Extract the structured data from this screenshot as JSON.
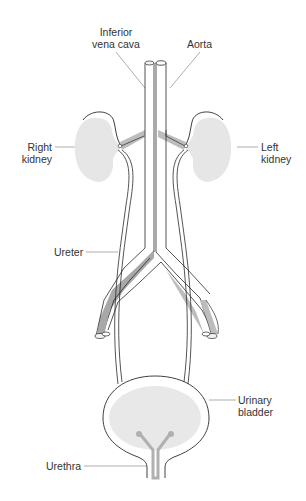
{
  "figure": {
    "type": "anatomical-diagram",
    "colors": {
      "background": "#ffffff",
      "outline": "#2a2a2a",
      "tissue_fill": "#e6e6e6",
      "vein_fill": "#a8a8a8",
      "leader_line": "#8a8a8a",
      "label_text": "#333333"
    }
  },
  "labels": {
    "ivc": {
      "line1": "Inferior",
      "line2": "vena cava"
    },
    "aorta": {
      "line1": "Aorta"
    },
    "right_kidney": {
      "line1": "Right",
      "line2": "kidney"
    },
    "left_kidney": {
      "line1": "Left",
      "line2": "kidney"
    },
    "ureter": {
      "line1": "Ureter"
    },
    "bladder": {
      "line1": "Urinary",
      "line2": "bladder"
    },
    "urethra": {
      "line1": "Urethra"
    }
  }
}
